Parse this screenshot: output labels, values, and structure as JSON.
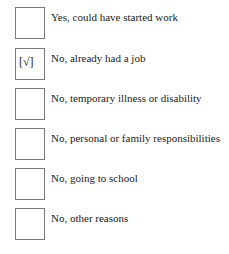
{
  "options": [
    {
      "label": "Yes, could have started work",
      "checked": false,
      "mark": ""
    },
    {
      "label": "No, already had a job",
      "checked": true,
      "mark": "[√]"
    },
    {
      "label": "No, temporary illness or disability",
      "checked": false,
      "mark": ""
    },
    {
      "label": "No, personal or family responsibilities",
      "checked": false,
      "mark": ""
    },
    {
      "label": "No, going to school",
      "checked": false,
      "mark": ""
    },
    {
      "label": "No, other reasons",
      "checked": false,
      "mark": ""
    }
  ]
}
